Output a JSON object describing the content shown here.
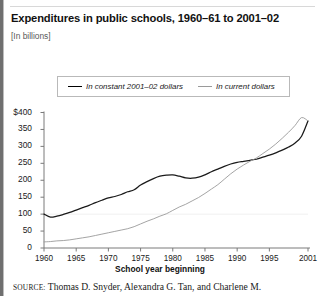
{
  "figure": {
    "title": "Expenditures in public schools, 1960–61 to 2001–02",
    "subtitle": "[In billions]",
    "source_keyword": "SOURCE:",
    "source_text": " Thomas D. Snyder, Alexandra G. Tan, and Charlene M."
  },
  "chart_data": {
    "type": "line",
    "title": "Expenditures in public schools, 1960–61 to 2001–02",
    "subtitle": "[In billions]",
    "xlabel": "School year beginning",
    "ylabel": "",
    "xlim": [
      1960,
      2001
    ],
    "ylim": [
      0,
      400
    ],
    "grid": false,
    "legend_position": "top-center",
    "ytick_labels": [
      "$400",
      "350",
      "300",
      "250",
      "200",
      "150",
      "100",
      "50",
      "0"
    ],
    "ytick_values": [
      400,
      350,
      300,
      250,
      200,
      150,
      100,
      50,
      0
    ],
    "xtick_labels": [
      "1960",
      "1965",
      "1970",
      "1975",
      "1980",
      "1985",
      "1990",
      "1995",
      "2001"
    ],
    "xtick_values": [
      1960,
      1965,
      1970,
      1975,
      1980,
      1985,
      1990,
      1995,
      2001
    ],
    "x": [
      1960,
      1961,
      1962,
      1963,
      1964,
      1965,
      1966,
      1967,
      1968,
      1969,
      1970,
      1971,
      1972,
      1973,
      1974,
      1975,
      1976,
      1977,
      1978,
      1979,
      1980,
      1981,
      1982,
      1983,
      1984,
      1985,
      1986,
      1987,
      1988,
      1989,
      1990,
      1991,
      1992,
      1993,
      1994,
      1995,
      1996,
      1997,
      1998,
      1999,
      2000,
      2001
    ],
    "series": [
      {
        "name": "In constant 2001–02 dollars",
        "color": "#1a1a1a",
        "style": "solid",
        "values": [
          100,
          91,
          94,
          99,
          105,
          112,
          119,
          126,
          134,
          141,
          148,
          152,
          158,
          166,
          172,
          186,
          196,
          205,
          212,
          215,
          216,
          212,
          207,
          206,
          209,
          216,
          225,
          233,
          241,
          248,
          253,
          256,
          259,
          262,
          268,
          274,
          281,
          289,
          298,
          310,
          330,
          375
        ]
      },
      {
        "name": "In current dollars",
        "color": "#9a9a9a",
        "style": "solid",
        "values": [
          18,
          19,
          21,
          22,
          24,
          27,
          30,
          33,
          37,
          41,
          45,
          49,
          53,
          57,
          63,
          71,
          79,
          86,
          94,
          101,
          111,
          121,
          129,
          139,
          149,
          161,
          174,
          187,
          203,
          219,
          233,
          245,
          256,
          266,
          279,
          292,
          307,
          324,
          342,
          362,
          385,
          375
        ]
      }
    ],
    "annotations": []
  }
}
